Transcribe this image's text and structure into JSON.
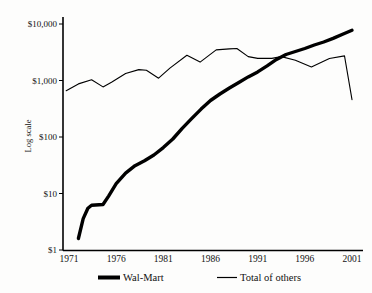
{
  "chart_data": {
    "type": "line",
    "title": "",
    "xlabel": "",
    "ylabel": "Log scale",
    "y_scale": "log",
    "ylim": [
      1,
      10000
    ],
    "x_range": [
      1971,
      2001
    ],
    "grid": false,
    "legend_position": "bottom",
    "y_ticks": [
      "$10,000",
      "$1,000",
      "$100",
      "$10",
      "$1"
    ],
    "y_tick_values": [
      10000,
      1000,
      100,
      10,
      1
    ],
    "x_ticks": [
      "1971",
      "1976",
      "1981",
      "1986",
      "1991",
      "1996",
      "2001"
    ],
    "x_tick_values": [
      1971,
      1976,
      1981,
      1986,
      1991,
      1996,
      2001
    ],
    "line_color": "#000000",
    "series": [
      {
        "name": "Wal-Mart",
        "style": "thick",
        "points": [
          [
            1972,
            1.6
          ],
          [
            1972.5,
            3.6
          ],
          [
            1973,
            5.5
          ],
          [
            1973.4,
            6.2
          ],
          [
            1974.6,
            6.4
          ],
          [
            1975.2,
            9
          ],
          [
            1976,
            15
          ],
          [
            1977,
            23
          ],
          [
            1978,
            31
          ],
          [
            1979,
            38
          ],
          [
            1980,
            48
          ],
          [
            1981,
            65
          ],
          [
            1982,
            92
          ],
          [
            1983,
            142
          ],
          [
            1984,
            212
          ],
          [
            1985,
            312
          ],
          [
            1986,
            443
          ],
          [
            1987,
            577
          ],
          [
            1988,
            736
          ],
          [
            1989,
            920
          ],
          [
            1990,
            1160
          ],
          [
            1991,
            1420
          ],
          [
            1992,
            1810
          ],
          [
            1993,
            2360
          ],
          [
            1994,
            2880
          ],
          [
            1995,
            3260
          ],
          [
            1996,
            3680
          ],
          [
            1997,
            4250
          ],
          [
            1998,
            4810
          ],
          [
            1999,
            5550
          ],
          [
            2000,
            6560
          ],
          [
            2001,
            7750
          ]
        ]
      },
      {
        "name": "Total of others",
        "style": "thin",
        "points": [
          [
            1970.7,
            660
          ],
          [
            1972,
            870
          ],
          [
            1973.4,
            1030
          ],
          [
            1974.6,
            770
          ],
          [
            1975.5,
            930
          ],
          [
            1977,
            1330
          ],
          [
            1978.4,
            1560
          ],
          [
            1979.2,
            1520
          ],
          [
            1980.5,
            1100
          ],
          [
            1981.7,
            1660
          ],
          [
            1983.5,
            2800
          ],
          [
            1984.9,
            2120
          ],
          [
            1986.6,
            3480
          ],
          [
            1988,
            3620
          ],
          [
            1988.8,
            3680
          ],
          [
            1990,
            2650
          ],
          [
            1991,
            2460
          ],
          [
            1992.5,
            2460
          ],
          [
            1993.5,
            2650
          ],
          [
            1995,
            2280
          ],
          [
            1996.7,
            1740
          ],
          [
            1998.6,
            2450
          ],
          [
            2000.2,
            2720
          ],
          [
            2001,
            460
          ]
        ]
      }
    ]
  }
}
